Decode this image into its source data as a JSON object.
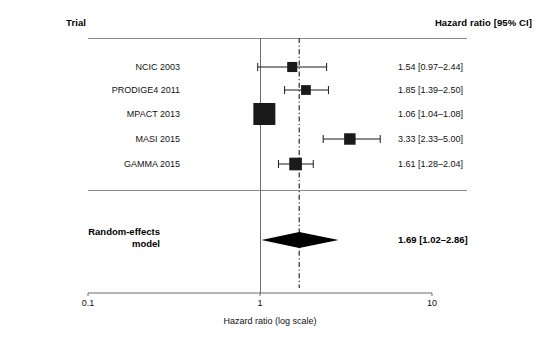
{
  "header": {
    "trial_label": "Trial",
    "hr_label": "Hazard ratio [95% CI]"
  },
  "summary": {
    "label_line1": "Random-effects",
    "label_line2": "model",
    "value": "1.69 [1.02–2.86]"
  },
  "axis": {
    "title": "Hazard ratio (log scale)",
    "ticks": [
      "0.1",
      "1",
      "10"
    ]
  },
  "studies": [
    {
      "label": "NCIC 2003",
      "value": "1.54 [0.97–2.44]"
    },
    {
      "label": "PRODIGE4 2011",
      "value": "1.85 [1.39–2.50]"
    },
    {
      "label": "MPACT 2013",
      "value": "1.06 [1.04–1.08]"
    },
    {
      "label": "MASI 2015",
      "value": "3.33 [2.33–5.00]"
    },
    {
      "label": "GAMMA 2015",
      "value": "1.61 [1.28–2.04]"
    }
  ],
  "chart_data": {
    "type": "forest",
    "title": "",
    "xlabel": "Hazard ratio (log scale)",
    "ylabel": "",
    "xscale": "log",
    "xlim": [
      0.1,
      10
    ],
    "xticks": [
      0.1,
      1,
      10
    ],
    "xticklabels": [
      "0.1",
      "1",
      "10"
    ],
    "grid": false,
    "legend": "none",
    "effect_measure": "Hazard ratio",
    "null_line": 1,
    "summary_line": 1.69,
    "columns": [
      "Trial",
      "Hazard ratio [95% CI]"
    ],
    "studies": [
      {
        "name": "NCIC 2003",
        "estimate": 1.54,
        "ci_low": 0.97,
        "ci_high": 2.44,
        "weight_marker": 0.3,
        "label": "1.54 [0.97–2.44]"
      },
      {
        "name": "PRODIGE4 2011",
        "estimate": 1.85,
        "ci_low": 1.39,
        "ci_high": 2.5,
        "weight_marker": 0.28,
        "label": "1.85 [1.39–2.50]"
      },
      {
        "name": "MPACT 2013",
        "estimate": 1.06,
        "ci_low": 1.04,
        "ci_high": 1.08,
        "weight_marker": 1.0,
        "label": "1.06 [1.04–1.08]"
      },
      {
        "name": "MASI 2015",
        "estimate": 3.33,
        "ci_low": 2.33,
        "ci_high": 5.0,
        "weight_marker": 0.38,
        "label": "3.33 [2.33–5.00]"
      },
      {
        "name": "GAMMA 2015",
        "estimate": 1.61,
        "ci_low": 1.28,
        "ci_high": 2.04,
        "weight_marker": 0.45,
        "label": "1.61 [1.28–2.04]"
      }
    ],
    "summary": {
      "name": "Random-effects model",
      "estimate": 1.69,
      "ci_low": 1.02,
      "ci_high": 2.86,
      "label": "1.69 [1.02–2.86]"
    },
    "colors": {
      "marker": "#1a1a1a",
      "diamond": "#000000",
      "null_line": "#6b6b6b",
      "summary_line": "#1a1a1a",
      "axis": "#6b6b6b",
      "text": "#111111"
    }
  }
}
